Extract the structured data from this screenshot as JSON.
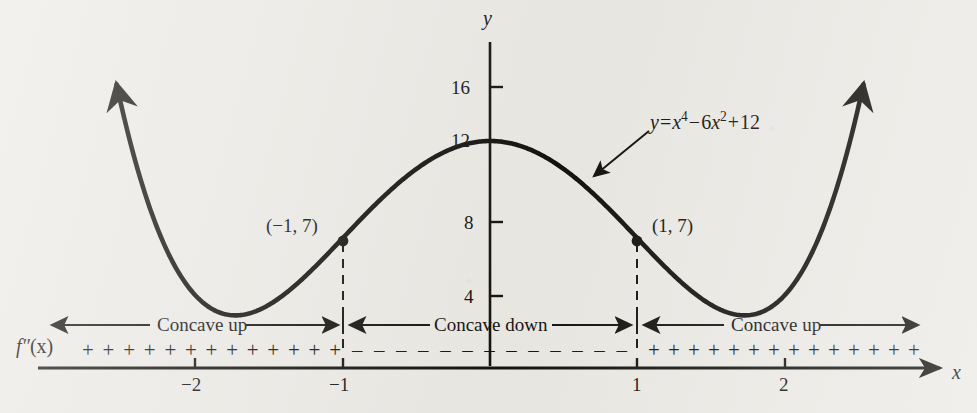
{
  "figure": {
    "kind": "calculus-concavity-diagram",
    "background_color": "#eceae5",
    "ink_color": "#14120f"
  },
  "axes": {
    "x_axis_label": "x",
    "y_axis_label": "y",
    "x_ticks": [
      {
        "value": -2,
        "label": "−2"
      },
      {
        "value": -1,
        "label": "−1"
      },
      {
        "value": 1,
        "label": "1"
      },
      {
        "value": 2,
        "label": "2"
      }
    ],
    "y_ticks": [
      {
        "value": 4,
        "label": "4"
      },
      {
        "value": 8,
        "label": "8"
      },
      {
        "value": 12,
        "label": "12"
      },
      {
        "value": 16,
        "label": "16"
      }
    ]
  },
  "equation": {
    "lhs": "y",
    "equals": "=",
    "term1_base": "x",
    "term1_exp": "4",
    "minus": "−",
    "term2_coef": "6",
    "term2_base": "x",
    "term2_exp": "2",
    "plus": "+",
    "constant": "12",
    "plain": "y = x⁴ − 6x² + 12"
  },
  "inflection_points": [
    {
      "label": "(−1, 7)",
      "x": -1,
      "y": 7
    },
    {
      "label": "(1, 7)",
      "x": 1,
      "y": 7
    }
  ],
  "concavity_bands": [
    {
      "label": "Concave up",
      "interval": "(−∞, −1)",
      "sign": "+"
    },
    {
      "label": "Concave down",
      "interval": "(−1, 1)",
      "sign": "−"
    },
    {
      "label": "Concave up",
      "interval": "(1, ∞)",
      "sign": "+"
    }
  ],
  "sign_row": {
    "function_label_f": "f",
    "function_label_primes": "″",
    "function_label_arg": "(x)",
    "function_label_plain": "f″(x)",
    "left_signs": [
      "+",
      "+",
      "+",
      "+",
      "+",
      "+",
      "+",
      "+",
      "+",
      "+",
      "+",
      "+",
      "+"
    ],
    "middle_signs": [
      "–",
      "–",
      "–",
      "–",
      "–",
      "–",
      "–",
      "–",
      "–",
      "–",
      "–",
      "–",
      "–"
    ],
    "right_signs": [
      "+",
      "+",
      "+",
      "+",
      "+",
      "+",
      "+",
      "+",
      "+",
      "+",
      "+",
      "+",
      "+",
      "+"
    ]
  },
  "chart_data": {
    "type": "line",
    "title": "",
    "xlabel": "x",
    "ylabel": "y",
    "xlim": [
      -2.62,
      2.62
    ],
    "ylim": [
      0,
      18.5
    ],
    "grid": false,
    "legend": null,
    "function": "y = x^4 - 6x^2 + 12",
    "x": [
      -2.6,
      -2.5,
      -2.4,
      -2.3,
      -2.2,
      -2.1,
      -2.0,
      -1.9,
      -1.8,
      -1.7,
      -1.6,
      -1.5,
      -1.4,
      -1.3,
      -1.2,
      -1.1,
      -1.0,
      -0.9,
      -0.8,
      -0.7,
      -0.6,
      -0.5,
      -0.4,
      -0.3,
      -0.2,
      -0.1,
      0.0,
      0.1,
      0.2,
      0.3,
      0.4,
      0.5,
      0.6,
      0.7,
      0.8,
      0.9,
      1.0,
      1.1,
      1.2,
      1.3,
      1.4,
      1.5,
      1.6,
      1.7,
      1.8,
      1.9,
      2.0,
      2.1,
      2.2,
      2.3,
      2.4,
      2.5,
      2.6
    ],
    "y": [
      17.13,
      14.56,
      12.63,
      10.24,
      8.39,
      7.01,
      4.0,
      4.7,
      3.06,
      3.01,
      3.17,
      3.56,
      4.08,
      4.72,
      5.43,
      6.2,
      7.0,
      7.8,
      8.57,
      9.28,
      9.92,
      10.44,
      10.87,
      11.19,
      11.4,
      11.54,
      12.0,
      11.54,
      11.4,
      11.19,
      10.87,
      10.44,
      9.92,
      9.28,
      8.57,
      7.8,
      7.0,
      6.2,
      5.43,
      4.72,
      4.08,
      3.56,
      3.17,
      3.01,
      3.06,
      4.7,
      4.0,
      7.01,
      8.39,
      10.24,
      12.63,
      14.56,
      17.13
    ],
    "key_points": [
      {
        "name": "local-maximum",
        "x": 0,
        "y": 12
      },
      {
        "name": "local-minimum-left",
        "x": -1.732,
        "y": 3
      },
      {
        "name": "local-minimum-right",
        "x": 1.732,
        "y": 3
      },
      {
        "name": "inflection-left",
        "x": -1,
        "y": 7
      },
      {
        "name": "inflection-right",
        "x": 1,
        "y": 7
      }
    ],
    "annotations": [
      {
        "text": "y = x⁴ − 6x² + 12",
        "x": 1.1,
        "y": 13.6
      },
      {
        "text": "(−1, 7)",
        "x": -1.35,
        "y": 7.9
      },
      {
        "text": "(1, 7)",
        "x": 1.15,
        "y": 7.9
      }
    ]
  }
}
